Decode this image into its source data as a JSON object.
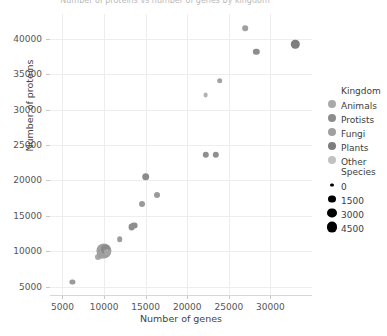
{
  "chart_data": {
    "type": "scatter",
    "title": "Number of proteins vs number of genes by kingdom",
    "xlabel": "Number of genes",
    "ylabel": "Number of proteins",
    "xlim": [
      3500,
      35000
    ],
    "ylim": [
      3800,
      43500
    ],
    "xticks": [
      5000,
      10000,
      15000,
      20000,
      25000,
      30000
    ],
    "yticks": [
      5000,
      10000,
      15000,
      20000,
      25000,
      30000,
      35000,
      40000
    ],
    "grid": true,
    "legend_position": "right",
    "points": [
      {
        "x": 6200,
        "y": 5600,
        "size": 2.6,
        "color": "#9a9a9a"
      },
      {
        "x": 9300,
        "y": 9100,
        "size": 3.0,
        "color": "#a8a8a8"
      },
      {
        "x": 9600,
        "y": 9400,
        "size": 3.4,
        "color": "#9c9c9c"
      },
      {
        "x": 9800,
        "y": 9700,
        "size": 3.2,
        "color": "#8f8f8f"
      },
      {
        "x": 10000,
        "y": 10000,
        "size": 7.6,
        "color": "#9f9f9f"
      },
      {
        "x": 10150,
        "y": 10250,
        "size": 4.2,
        "color": "#8a8a8a"
      },
      {
        "x": 10300,
        "y": 9850,
        "size": 3.0,
        "color": "#a5a5a5"
      },
      {
        "x": 11900,
        "y": 11700,
        "size": 2.8,
        "color": "#9d9d9d"
      },
      {
        "x": 13300,
        "y": 13400,
        "size": 3.4,
        "color": "#8e8e8e"
      },
      {
        "x": 13650,
        "y": 13600,
        "size": 3.4,
        "color": "#8e8e8e"
      },
      {
        "x": 14600,
        "y": 16700,
        "size": 3.0,
        "color": "#9a9a9a"
      },
      {
        "x": 15000,
        "y": 20500,
        "size": 3.8,
        "color": "#8b8b8b"
      },
      {
        "x": 16400,
        "y": 17900,
        "size": 3.0,
        "color": "#9a9a9a"
      },
      {
        "x": 22200,
        "y": 23600,
        "size": 3.2,
        "color": "#8f8f8f"
      },
      {
        "x": 23400,
        "y": 23600,
        "size": 3.2,
        "color": "#8f8f8f"
      },
      {
        "x": 22200,
        "y": 32000,
        "size": 2.4,
        "color": "#b4b4b4"
      },
      {
        "x": 23900,
        "y": 34100,
        "size": 2.8,
        "color": "#a2a2a2"
      },
      {
        "x": 27000,
        "y": 41500,
        "size": 2.8,
        "color": "#a0a0a0"
      },
      {
        "x": 28300,
        "y": 38200,
        "size": 3.2,
        "color": "#8d8d8d"
      },
      {
        "x": 33000,
        "y": 39200,
        "size": 4.2,
        "color": "#7f7f7f"
      }
    ],
    "legends": [
      {
        "title": "Kingdom",
        "type": "color",
        "entries": [
          {
            "label": "Animals",
            "color": "#a9a9a9",
            "size": 4.0
          },
          {
            "label": "Protists",
            "color": "#8c8c8c",
            "size": 4.0
          },
          {
            "label": "Fungi",
            "color": "#a0a0a0",
            "size": 4.0
          },
          {
            "label": "Plants",
            "color": "#7d7d7d",
            "size": 4.0
          },
          {
            "label": "Other",
            "color": "#c2c2c2",
            "size": 4.0
          }
        ]
      },
      {
        "title": "Species",
        "type": "size",
        "entries": [
          {
            "label": "0",
            "color": "#000000",
            "size": 1.6
          },
          {
            "label": "1500",
            "color": "#000000",
            "size": 3.6
          },
          {
            "label": "3000",
            "color": "#000000",
            "size": 4.6
          },
          {
            "label": "4500",
            "color": "#000000",
            "size": 5.4
          }
        ]
      }
    ]
  }
}
